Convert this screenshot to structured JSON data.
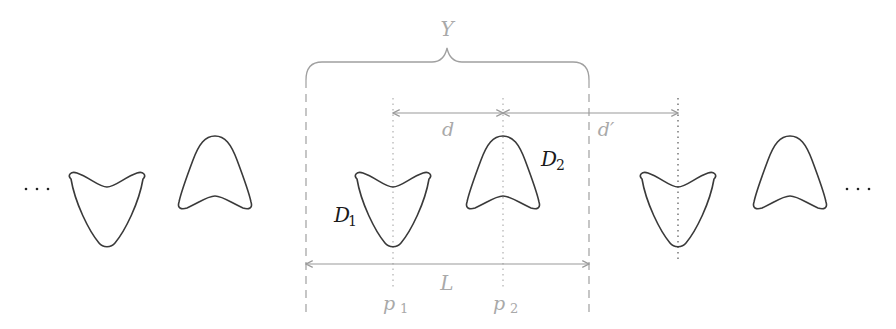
{
  "diagram": {
    "labels": {
      "brace_label": "Y",
      "distance_d": "d",
      "distance_d_prime": "d′",
      "domain_1": "D",
      "domain_1_sub": "1",
      "domain_2": "D",
      "domain_2_sub": "2",
      "period_length": "L",
      "point_1": "p",
      "point_1_sub": "1",
      "point_2": "p",
      "point_2_sub": "2",
      "ellipsis_left": "···",
      "ellipsis_right": "···"
    },
    "shapes": [
      {
        "type": "V-down",
        "center_x": 107
      },
      {
        "type": "A-up",
        "center_x": 215
      },
      {
        "type": "V-down",
        "center_x": 393,
        "label": "D1"
      },
      {
        "type": "A-up",
        "center_x": 503,
        "label": "D2"
      },
      {
        "type": "V-down",
        "center_x": 678
      },
      {
        "type": "A-up",
        "center_x": 790
      }
    ],
    "colors": {
      "shape_stroke": "#3a3a3a",
      "annotation_gray": "#a0a0a0",
      "label_dark": "#1a1a1a"
    }
  }
}
